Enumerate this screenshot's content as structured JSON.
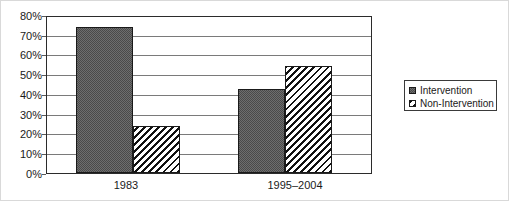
{
  "chart_data": {
    "type": "bar",
    "title": "",
    "subtitle": "",
    "xlabel": "",
    "ylabel": "",
    "categories": [
      "1983",
      "1995–2004"
    ],
    "series": [
      {
        "name": "Intervention",
        "values": [
          75,
          43
        ],
        "fill": "checkerboard-dither",
        "color": "#6e6e6e"
      },
      {
        "name": "Non-Intervention",
        "values": [
          24,
          55
        ],
        "fill": "diagonal-hatch",
        "color": "#ffffff"
      }
    ],
    "ylim": [
      0,
      80
    ],
    "y_tick_step": 10,
    "y_tick_labels": [
      "0%",
      "10%",
      "20%",
      "30%",
      "40%",
      "50%",
      "60%",
      "70%",
      "80%"
    ],
    "y_tick_values": [
      0,
      10,
      20,
      30,
      40,
      50,
      60,
      70,
      80
    ],
    "value_format": "percent",
    "grid": true,
    "grid_axis": "y",
    "legend_position": "right",
    "legend_entries": [
      "Intervention",
      "Non-Intervention"
    ],
    "annotations": []
  },
  "axis": {
    "y_ticks": [
      {
        "label": "80%",
        "value": 80
      },
      {
        "label": "70%",
        "value": 70
      },
      {
        "label": "60%",
        "value": 60
      },
      {
        "label": "50%",
        "value": 50
      },
      {
        "label": "40%",
        "value": 40
      },
      {
        "label": "30%",
        "value": 30
      },
      {
        "label": "20%",
        "value": 20
      },
      {
        "label": "10%",
        "value": 10
      },
      {
        "label": "0%",
        "value": 0
      }
    ],
    "x_categories": [
      {
        "label": "1983"
      },
      {
        "label": "1995–2004"
      }
    ]
  },
  "legend": {
    "items": [
      {
        "label": "Intervention"
      },
      {
        "label": "Non-Intervention"
      }
    ]
  },
  "colors": {
    "axis": "#2b2b2b",
    "gridline": "#7a7a7a",
    "text": "#1a1a1a",
    "intervention_fill": "#6e6e6e",
    "non_intervention_fill": "#ffffff",
    "frame": "#d9d9d9"
  }
}
